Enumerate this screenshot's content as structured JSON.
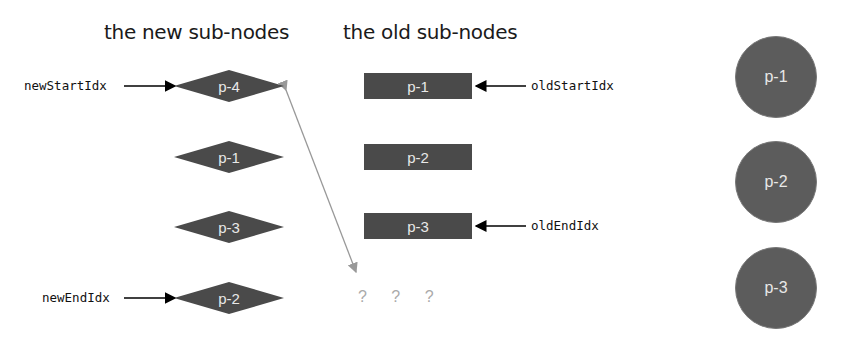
{
  "headings": {
    "new": "the new sub-nodes",
    "old": "the old sub-nodes"
  },
  "new_nodes": [
    {
      "label": "p-4"
    },
    {
      "label": "p-1"
    },
    {
      "label": "p-3"
    },
    {
      "label": "p-2"
    }
  ],
  "old_nodes": [
    {
      "label": "p-1"
    },
    {
      "label": "p-2"
    },
    {
      "label": "p-3"
    }
  ],
  "real_dom_nodes": [
    {
      "label": "p-1"
    },
    {
      "label": "p-2"
    },
    {
      "label": "p-3"
    }
  ],
  "pointers": {
    "new_start": "newStartIdx",
    "new_end": "newEndIdx",
    "old_start": "oldStartIdx",
    "old_end": "oldEndIdx"
  },
  "placeholder": "? ? ?",
  "colors": {
    "node_fill": "#4a4a4a",
    "circle_fill": "#5c5c5c",
    "node_text": "#e8e8e8",
    "move_arrow": "#999999",
    "pointer_arrow": "#000000"
  }
}
